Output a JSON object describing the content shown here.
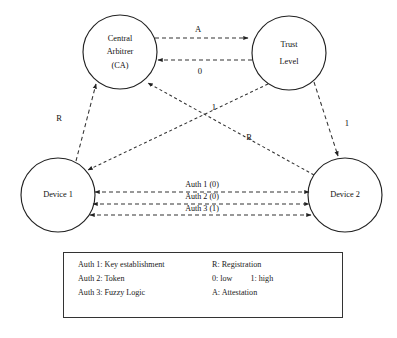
{
  "diagram": {
    "nodes": [
      {
        "id": "ca",
        "label_line1": "Central",
        "label_line2": "Arbitrer",
        "label_line3": "(CA)",
        "cx": 120,
        "cy": 52,
        "r": 37
      },
      {
        "id": "trust",
        "label_line1": "Trust",
        "label_line2": "Level",
        "label_line3": "",
        "cx": 289,
        "cy": 53,
        "r": 37
      },
      {
        "id": "device1",
        "label_line1": "Device 1",
        "label_line2": "",
        "label_line3": "",
        "cx": 58,
        "cy": 195,
        "r": 37
      },
      {
        "id": "device2",
        "label_line1": "Device 2",
        "label_line2": "",
        "label_line3": "",
        "cx": 345,
        "cy": 195,
        "r": 37
      }
    ],
    "edges": [
      {
        "id": "ca-to-trust",
        "label": "A",
        "from": "ca",
        "to": "trust",
        "style": "dashed"
      },
      {
        "id": "trust-to-ca",
        "label": "0",
        "from": "trust",
        "to": "ca",
        "style": "dashed"
      },
      {
        "id": "device1-to-ca",
        "label": "R",
        "from": "device1",
        "to": "ca",
        "style": "dashed"
      },
      {
        "id": "device2-to-ca",
        "label": "R",
        "from": "device2",
        "to": "ca",
        "style": "dashed"
      },
      {
        "id": "trust-to-device1",
        "label": "1",
        "from": "trust",
        "to": "device1",
        "style": "dashed"
      },
      {
        "id": "trust-to-device2",
        "label": "1",
        "from": "trust",
        "to": "device2",
        "style": "dashed"
      },
      {
        "id": "auth1",
        "label": "Auth 1 (0)",
        "from": "device1",
        "to": "device2",
        "style": "dashed-bidirectional"
      },
      {
        "id": "auth2",
        "label": "Auth 2 (0)",
        "from": "device1",
        "to": "device2",
        "style": "dashed-bidirectional"
      },
      {
        "id": "auth3",
        "label": "Auth 3 (1)",
        "from": "device1",
        "to": "device2",
        "style": "dashed-bidirectional"
      }
    ]
  },
  "legend": {
    "rows": [
      {
        "left": "Auth 1: Key establishment",
        "right": "R: Registration",
        "right_extra": ""
      },
      {
        "left": "Auth 2: Token",
        "right": "0: low",
        "right_extra": "1: high"
      },
      {
        "left": "Auth 3: Fuzzy Logic",
        "right": "A: Attestation",
        "right_extra": ""
      }
    ]
  },
  "colors": {
    "stroke": "#333333",
    "node_stroke": "#222222",
    "text": "#111111",
    "background": "#ffffff"
  }
}
